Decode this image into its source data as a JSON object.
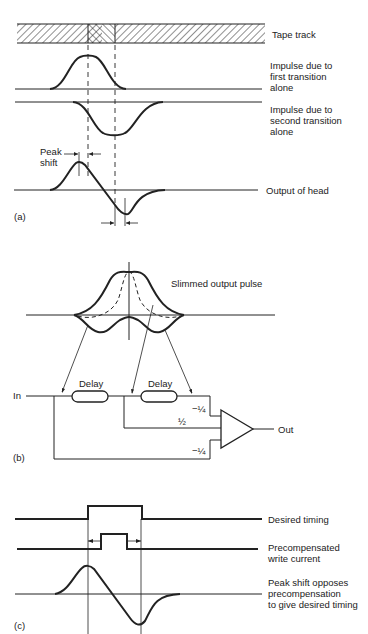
{
  "panel_a": {
    "tag": "(a)",
    "labels": {
      "tape_track": "Tape track",
      "impulse_first": "Impulse due to\nfirst transition\nalone",
      "impulse_second": "Impulse due to\nsecond transition\nalone",
      "peak_shift": "Peak\nshift",
      "output": "Output of head"
    }
  },
  "panel_b": {
    "tag": "(b)",
    "labels": {
      "slimmed": "Slimmed output pulse",
      "in": "In",
      "out": "Out",
      "delay1": "Delay",
      "delay2": "Delay",
      "coef_top": "−¼",
      "coef_mid": "½",
      "coef_bot": "−¼"
    }
  },
  "panel_c": {
    "tag": "(c)",
    "labels": {
      "desired": "Desired timing",
      "precomp": "Precompensated\nwrite current",
      "peak_opposes": "Peak shift opposes\nprecompensation\nto give desired timing"
    }
  },
  "colors": {
    "ink": "#222222",
    "background": "#ffffff"
  }
}
